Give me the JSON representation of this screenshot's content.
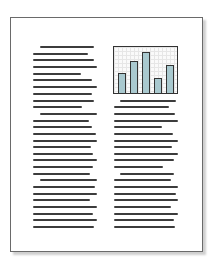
{
  "document": {
    "description": "Two-column page thumbnail with embedded bar chart",
    "line_color": "#3c3c3c",
    "left_column": {
      "x": 33,
      "lines": [
        {
          "y": 46,
          "x": 40,
          "w": 54
        },
        {
          "y": 53,
          "w": 55
        },
        {
          "y": 59,
          "w": 61
        },
        {
          "y": 66,
          "w": 64
        },
        {
          "y": 73,
          "w": 48
        },
        {
          "y": 79,
          "w": 59
        },
        {
          "y": 86,
          "w": 64
        },
        {
          "y": 93,
          "w": 59
        },
        {
          "y": 100,
          "w": 61
        },
        {
          "y": 106,
          "w": 49
        },
        {
          "y": 113,
          "x": 40,
          "w": 57
        },
        {
          "y": 120,
          "w": 56
        },
        {
          "y": 126,
          "w": 59
        },
        {
          "y": 133,
          "w": 63
        },
        {
          "y": 140,
          "w": 64
        },
        {
          "y": 146,
          "w": 58
        },
        {
          "y": 153,
          "w": 60
        },
        {
          "y": 159,
          "w": 64
        },
        {
          "y": 166,
          "w": 60
        },
        {
          "y": 173,
          "w": 57
        },
        {
          "y": 179,
          "x": 40,
          "w": 57
        },
        {
          "y": 186,
          "w": 62
        },
        {
          "y": 193,
          "w": 64
        },
        {
          "y": 199,
          "w": 57
        },
        {
          "y": 206,
          "w": 64
        },
        {
          "y": 213,
          "w": 60
        },
        {
          "y": 219,
          "w": 64
        },
        {
          "y": 226,
          "w": 61
        }
      ]
    },
    "right_column": {
      "x": 114,
      "lines": [
        {
          "y": 100,
          "x": 120,
          "w": 56
        },
        {
          "y": 106,
          "w": 55
        },
        {
          "y": 113,
          "w": 61
        },
        {
          "y": 120,
          "w": 64
        },
        {
          "y": 126,
          "w": 48
        },
        {
          "y": 133,
          "w": 59
        },
        {
          "y": 140,
          "w": 64
        },
        {
          "y": 146,
          "w": 58
        },
        {
          "y": 153,
          "w": 64
        },
        {
          "y": 159,
          "w": 60
        },
        {
          "y": 166,
          "w": 49
        },
        {
          "y": 173,
          "x": 120,
          "w": 54
        },
        {
          "y": 179,
          "w": 57
        },
        {
          "y": 186,
          "w": 64
        },
        {
          "y": 193,
          "w": 62
        },
        {
          "y": 199,
          "w": 64
        },
        {
          "y": 206,
          "w": 57
        },
        {
          "y": 213,
          "w": 64
        },
        {
          "y": 219,
          "w": 60
        },
        {
          "y": 226,
          "w": 61
        }
      ]
    }
  },
  "chart_data": {
    "type": "bar",
    "title": "",
    "xlabel": "",
    "ylabel": "",
    "categories": [
      "1",
      "2",
      "3",
      "4",
      "5"
    ],
    "values": [
      19,
      31,
      40,
      14,
      27
    ],
    "ylim": [
      0,
      46
    ],
    "bar_color": "#a9c9cf",
    "grid": true,
    "bar_x": [
      4,
      16,
      28,
      40,
      52
    ]
  }
}
